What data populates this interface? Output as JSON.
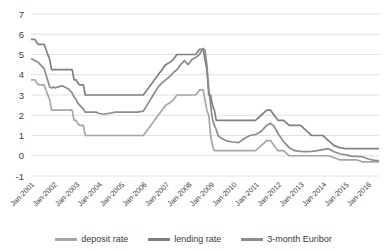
{
  "chart_data": {
    "type": "line",
    "title": "",
    "subtitle": "",
    "xlabel": "",
    "ylabel": "",
    "ylim": [
      -1,
      7
    ],
    "ytick_values": [
      7,
      6,
      5,
      4,
      3,
      2,
      1,
      0,
      -1
    ],
    "ytick_labels": [
      "7",
      "6",
      "5",
      "4",
      "3",
      "2",
      "1",
      "0",
      "-1"
    ],
    "grid": true,
    "legend_position": "bottom",
    "xlim": [
      "Jan-2001",
      "Jan-2016"
    ],
    "x_tick_labels": [
      "Jan-2001",
      "Jan-2002",
      "Jan-2003",
      "Jan-2004",
      "Jan-2005",
      "Jan-2006",
      "Jan-2007",
      "Jan-2008",
      "Jan-2009",
      "Jan-2010",
      "Jan-2011",
      "Jan-2012",
      "Jan-2013",
      "Jan-2014",
      "Jan-2015",
      "Jan-2016"
    ],
    "x": [
      2001.0,
      2001.083,
      2001.167,
      2001.25,
      2001.333,
      2001.417,
      2001.5,
      2001.583,
      2001.667,
      2001.75,
      2001.833,
      2001.917,
      2002.0,
      2002.083,
      2002.167,
      2002.25,
      2002.333,
      2002.417,
      2002.5,
      2002.583,
      2002.667,
      2002.75,
      2002.833,
      2002.917,
      2003.0,
      2003.083,
      2003.167,
      2003.25,
      2003.333,
      2003.417,
      2003.5,
      2003.583,
      2003.667,
      2003.75,
      2003.833,
      2003.917,
      2004.0,
      2004.25,
      2004.5,
      2004.75,
      2005.0,
      2005.25,
      2005.5,
      2005.75,
      2006.0,
      2006.167,
      2006.333,
      2006.5,
      2006.667,
      2006.833,
      2007.0,
      2007.167,
      2007.333,
      2007.5,
      2007.667,
      2007.833,
      2008.0,
      2008.167,
      2008.333,
      2008.5,
      2008.667,
      2008.75,
      2008.833,
      2008.917,
      2009.0,
      2009.083,
      2009.167,
      2009.25,
      2009.333,
      2009.5,
      2009.75,
      2010.0,
      2010.25,
      2010.5,
      2010.75,
      2011.0,
      2011.25,
      2011.5,
      2011.667,
      2011.833,
      2012.0,
      2012.25,
      2012.5,
      2012.75,
      2013.0,
      2013.25,
      2013.5,
      2013.75,
      2014.0,
      2014.25,
      2014.5,
      2014.75,
      2015.0,
      2015.25,
      2015.5,
      2015.75,
      2016.0,
      2016.25,
      2016.5
    ],
    "series": [
      {
        "name": "deposit rate",
        "color": "#a6a6a6",
        "values": [
          3.75,
          3.75,
          3.75,
          3.6,
          3.5,
          3.5,
          3.5,
          3.5,
          3.25,
          3.0,
          2.75,
          2.25,
          2.25,
          2.25,
          2.25,
          2.25,
          2.25,
          2.25,
          2.25,
          2.25,
          2.25,
          2.25,
          2.25,
          1.75,
          1.75,
          1.6,
          1.5,
          1.5,
          1.5,
          1.0,
          1.0,
          1.0,
          1.0,
          1.0,
          1.0,
          1.0,
          1.0,
          1.0,
          1.0,
          1.0,
          1.0,
          1.0,
          1.0,
          1.0,
          1.0,
          1.25,
          1.5,
          1.75,
          2.0,
          2.25,
          2.5,
          2.6,
          2.75,
          3.0,
          3.0,
          3.0,
          3.0,
          3.0,
          3.0,
          3.25,
          3.25,
          2.75,
          2.25,
          2.0,
          1.0,
          0.5,
          0.25,
          0.25,
          0.25,
          0.25,
          0.25,
          0.25,
          0.25,
          0.25,
          0.25,
          0.25,
          0.5,
          0.75,
          0.75,
          0.5,
          0.25,
          0.25,
          0.0,
          0.0,
          0.0,
          0.0,
          0.0,
          0.0,
          0.0,
          0.0,
          -0.1,
          -0.2,
          -0.2,
          -0.2,
          -0.2,
          -0.3,
          -0.3,
          -0.3,
          -0.3
        ]
      },
      {
        "name": "lending rate",
        "color": "#808080",
        "values": [
          5.75,
          5.75,
          5.75,
          5.6,
          5.5,
          5.5,
          5.5,
          5.5,
          5.25,
          5.0,
          4.75,
          4.25,
          4.25,
          4.25,
          4.25,
          4.25,
          4.25,
          4.25,
          4.25,
          4.25,
          4.25,
          4.25,
          4.25,
          3.75,
          3.75,
          3.6,
          3.5,
          3.5,
          3.5,
          3.0,
          3.0,
          3.0,
          3.0,
          3.0,
          3.0,
          3.0,
          3.0,
          3.0,
          3.0,
          3.0,
          3.0,
          3.0,
          3.0,
          3.0,
          3.0,
          3.25,
          3.5,
          3.75,
          4.0,
          4.25,
          4.5,
          4.6,
          4.75,
          5.0,
          5.0,
          5.0,
          5.0,
          5.0,
          5.0,
          5.25,
          5.25,
          4.75,
          4.25,
          3.0,
          3.0,
          2.5,
          2.25,
          1.75,
          1.75,
          1.75,
          1.75,
          1.75,
          1.75,
          1.75,
          1.75,
          1.75,
          2.0,
          2.25,
          2.25,
          2.0,
          1.75,
          1.75,
          1.5,
          1.5,
          1.5,
          1.25,
          1.0,
          1.0,
          1.0,
          0.75,
          0.5,
          0.4,
          0.35,
          0.35,
          0.35,
          0.35,
          0.35,
          0.35,
          0.35
        ]
      },
      {
        "name": "3-month Euribor",
        "color": "#8c8c8c",
        "values": [
          4.8,
          4.75,
          4.7,
          4.65,
          4.6,
          4.5,
          4.4,
          4.3,
          4.0,
          3.7,
          3.4,
          3.35,
          3.4,
          3.35,
          3.4,
          3.4,
          3.45,
          3.45,
          3.4,
          3.35,
          3.3,
          3.2,
          3.1,
          2.9,
          2.8,
          2.6,
          2.5,
          2.4,
          2.3,
          2.15,
          2.15,
          2.15,
          2.15,
          2.15,
          2.15,
          2.15,
          2.1,
          2.05,
          2.1,
          2.15,
          2.15,
          2.15,
          2.15,
          2.15,
          2.2,
          2.5,
          2.8,
          3.1,
          3.4,
          3.6,
          3.75,
          3.9,
          4.1,
          4.25,
          4.5,
          4.7,
          4.5,
          4.75,
          4.85,
          5.0,
          5.3,
          5.2,
          4.5,
          3.3,
          2.5,
          1.8,
          1.5,
          1.3,
          1.0,
          0.85,
          0.72,
          0.68,
          0.65,
          0.85,
          1.0,
          1.05,
          1.2,
          1.5,
          1.6,
          1.45,
          1.1,
          0.7,
          0.4,
          0.25,
          0.22,
          0.2,
          0.22,
          0.25,
          0.3,
          0.35,
          0.2,
          0.1,
          0.05,
          -0.02,
          -0.03,
          -0.05,
          -0.15,
          -0.22,
          -0.25
        ]
      }
    ]
  }
}
